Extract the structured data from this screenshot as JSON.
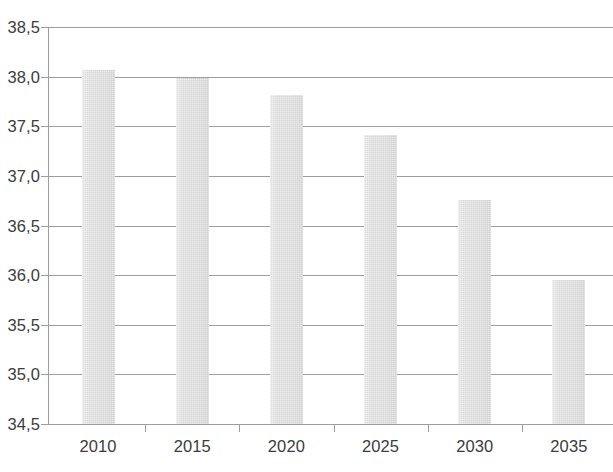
{
  "chart_data": {
    "type": "bar",
    "title": "",
    "xlabel": "",
    "ylabel": "",
    "categories": [
      "2010",
      "2015",
      "2020",
      "2025",
      "2030",
      "2035"
    ],
    "values": [
      38.07,
      37.99,
      37.81,
      37.41,
      36.76,
      35.95
    ],
    "ylim": [
      34.5,
      38.5
    ],
    "ytick_labels": [
      "38,5",
      "38,0",
      "37,5",
      "37,0",
      "36,5",
      "36,0",
      "35,5",
      "35,0",
      "34,5"
    ],
    "ytick_values": [
      38.5,
      38.0,
      37.5,
      37.0,
      36.5,
      36.0,
      35.5,
      35.0,
      34.5
    ],
    "grid": true,
    "legend": "none",
    "decimal_separator": ",",
    "series": [
      {
        "name": "",
        "values": [
          38.07,
          37.99,
          37.81,
          37.41,
          36.76,
          35.95
        ],
        "color": "#d4d4d4"
      }
    ]
  },
  "style": {
    "bar_color": "#d4d4d4",
    "grid_color": "#9d9d9d",
    "axis_color": "#9d9d9d",
    "text_color": "#3c3c3c",
    "background": "#ffffff"
  },
  "title_sliver": ""
}
